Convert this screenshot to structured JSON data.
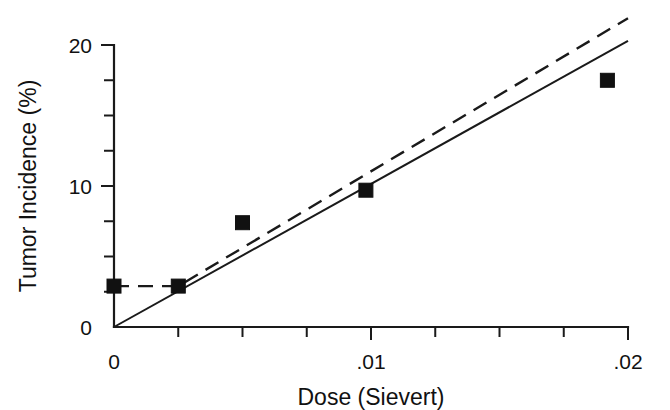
{
  "chart_data": {
    "type": "scatter",
    "title": "",
    "xlabel": "Dose (Sievert)",
    "ylabel": "Tumor Incidence (%)",
    "xlim": [
      0,
      0.02
    ],
    "ylim": [
      0,
      20
    ],
    "grid": false,
    "legend": "none",
    "x_major_ticks": [
      0,
      0.01,
      0.02
    ],
    "x_major_tick_labels": [
      "0",
      ".01",
      ".02"
    ],
    "x_minor_tick_step": 0.0025,
    "y_major_ticks": [
      0,
      10,
      20
    ],
    "y_major_tick_labels": [
      "0",
      "10",
      "20"
    ],
    "y_minor_tick_step": 2.5,
    "points": [
      {
        "x": 0.0,
        "y": 2.9
      },
      {
        "x": 0.0025,
        "y": 2.9
      },
      {
        "x": 0.005,
        "y": 7.4
      },
      {
        "x": 0.0098,
        "y": 9.7
      },
      {
        "x": 0.0192,
        "y": 17.5
      }
    ],
    "series": [
      {
        "name": "linear-no-threshold-fit",
        "style": "solid",
        "points": [
          {
            "x": 0.0,
            "y": 0.0
          },
          {
            "x": 0.02,
            "y": 20.3
          }
        ]
      },
      {
        "name": "threshold-fit",
        "style": "dashed",
        "points": [
          {
            "x": 0.0,
            "y": 2.9
          },
          {
            "x": 0.0025,
            "y": 2.9
          },
          {
            "x": 0.02,
            "y": 21.9
          }
        ]
      }
    ]
  },
  "axes": {
    "x_title": "Dose (Sievert)",
    "y_title": "Tumor Incidence (%)",
    "x_labels": [
      "0",
      ".01",
      ".02"
    ],
    "y_labels": [
      "0",
      "10",
      "20"
    ]
  },
  "colors": {
    "ink": "#111111",
    "background": "#ffffff"
  }
}
